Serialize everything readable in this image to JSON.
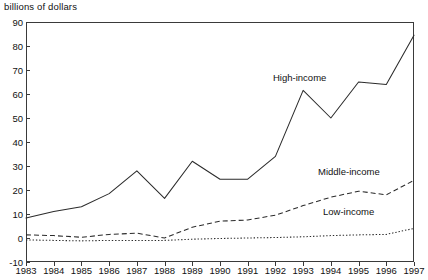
{
  "chart_data": {
    "type": "line",
    "title": "",
    "ylabel": "billions of dollars",
    "xlabel": "",
    "grid": false,
    "legend_position": "inline-annotations",
    "ylim": [
      -10,
      90
    ],
    "yticks": [
      -10,
      0,
      10,
      20,
      30,
      40,
      50,
      60,
      70,
      80,
      90
    ],
    "ytick_labels": [
      "-10",
      "0",
      "10",
      "20",
      "30",
      "40",
      "50",
      "60",
      "70",
      "80",
      "90"
    ],
    "categories": [
      "1983",
      "1984",
      "1985",
      "1986",
      "1987",
      "1988",
      "1989",
      "1990",
      "1991",
      "1992",
      "1993",
      "1994",
      "1995",
      "1996",
      "1997"
    ],
    "x": [
      1983,
      1984,
      1985,
      1986,
      1987,
      1988,
      1989,
      1990,
      1991,
      1992,
      1993,
      1994,
      1995,
      1996,
      1997
    ],
    "series": [
      {
        "name": "High-income",
        "style": "solid",
        "values": [
          8.3,
          11.0,
          13.0,
          18.5,
          28.0,
          16.5,
          32.0,
          24.5,
          24.5,
          34.0,
          61.5,
          50.0,
          65.0,
          64.0,
          84.5
        ]
      },
      {
        "name": "Middle-income",
        "style": "dashed",
        "values": [
          1.3,
          1.0,
          0.3,
          1.5,
          2.0,
          0.0,
          4.5,
          7.0,
          7.5,
          9.5,
          13.5,
          17.0,
          19.5,
          18.0,
          24.0
        ]
      },
      {
        "name": "Low-income",
        "style": "dotted",
        "values": [
          -0.8,
          -1.0,
          -1.2,
          -1.0,
          -1.0,
          -1.0,
          -0.5,
          -0.2,
          0.0,
          0.2,
          0.5,
          1.0,
          1.3,
          1.5,
          4.0
        ]
      }
    ],
    "annotations": [
      {
        "text": "High-income",
        "series": "High-income"
      },
      {
        "text": "Middle-income",
        "series": "Middle-income"
      },
      {
        "text": "Low-income",
        "series": "Low-income"
      }
    ],
    "colors": {
      "axis": "#3a3a3a",
      "high_income": "#2b2b2b",
      "middle_income": "#2b2b2b",
      "low_income": "#2b2b2b",
      "background": "#ffffff"
    }
  }
}
